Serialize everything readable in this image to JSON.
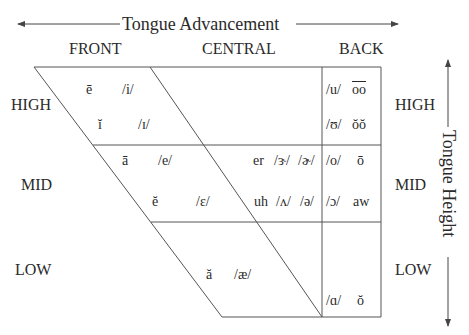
{
  "axes": {
    "horizontal_label": "Tongue Advancement",
    "vertical_label": "Tongue Height"
  },
  "columns": [
    "FRONT",
    "CENTRAL",
    "BACK"
  ],
  "rows_left": [
    "HIGH",
    "MID",
    "LOW"
  ],
  "rows_right": [
    "HIGH",
    "MID",
    "LOW"
  ],
  "cells": {
    "high_front_1": {
      "spelling": "ē",
      "ipa": "/i/"
    },
    "high_front_2": {
      "spelling": "ĭ",
      "ipa": "/ɪ/"
    },
    "high_back_1": {
      "ipa": "/u/",
      "spelling": "oo"
    },
    "high_back_2": {
      "ipa": "/ʊ/",
      "spelling": "ŏŏ"
    },
    "mid_front_1": {
      "spelling": "ā",
      "ipa": "/e/"
    },
    "mid_front_2": {
      "spelling": "ĕ",
      "ipa": "/ɛ/"
    },
    "mid_central_1": {
      "spelling": "er",
      "ipa1": "/ɝ/",
      "ipa2": "/ɚ/"
    },
    "mid_central_2": {
      "spelling": "uh",
      "ipa1": "/ʌ/",
      "ipa2": "/ə/"
    },
    "mid_back_1": {
      "ipa": "/o/",
      "spelling": "ō"
    },
    "mid_back_2": {
      "ipa": "/ɔ/",
      "spelling": "aw"
    },
    "low_central": {
      "spelling": "ă",
      "ipa": "/æ/"
    },
    "low_back": {
      "ipa": "/ɑ/",
      "spelling": "ŏ"
    }
  },
  "colors": {
    "line": "#555555",
    "text": "#2a2a2a"
  }
}
